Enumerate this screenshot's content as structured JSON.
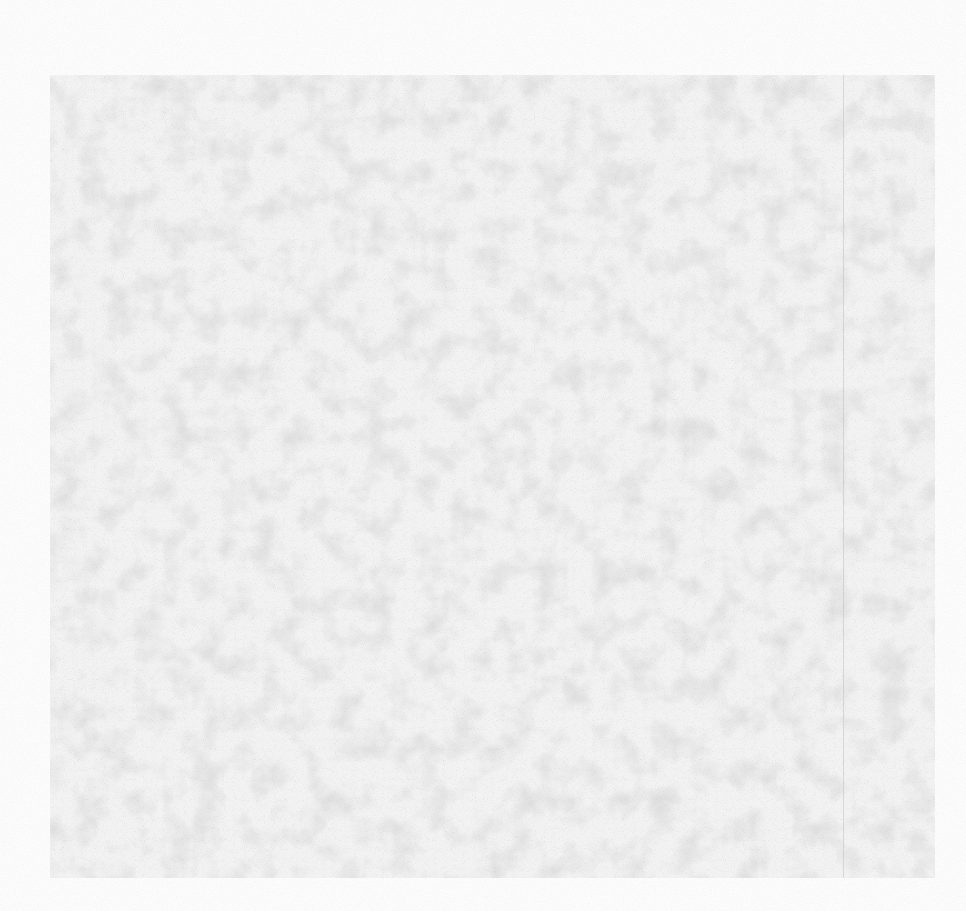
{
  "page": {
    "description": "",
    "colors": {
      "background": "#fcfcfc",
      "panel": "#f2f2f2",
      "speckle": "#8c8c8c"
    }
  },
  "panel": {
    "left": 50,
    "top": 75,
    "width": 885,
    "height": 803
  },
  "vertical_rule": {
    "x": 843
  }
}
